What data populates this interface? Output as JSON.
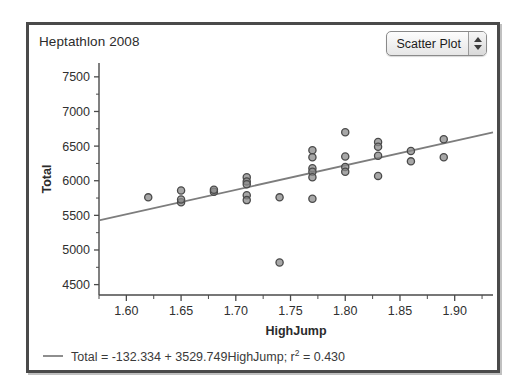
{
  "window": {
    "title": "Heptathlon 2008"
  },
  "controls": {
    "plot_type": {
      "selected": "Scatter Plot",
      "options": [
        "Scatter Plot",
        "Line Plot",
        "Bar Chart",
        "Histogram"
      ],
      "stepper_up_icon": "triangle-up-icon",
      "stepper_down_icon": "triangle-down-icon"
    }
  },
  "legend": {
    "equation_text": "Total = -132.334 + 3529.749HighJump; r",
    "r2_exponent": "2",
    "r2_value": " = 0.430",
    "line_color": "#8e8e8e"
  },
  "colors": {
    "point_fill": "#8a8a8a",
    "point_stroke": "#4a4a4a",
    "fit_line": "#7d7d7d",
    "axis": "#4a4a4a",
    "frame": "#4a4a4a"
  },
  "chart_data": {
    "type": "scatter",
    "title": "Heptathlon 2008",
    "xlabel": "HighJump",
    "ylabel": "Total",
    "xlim": [
      1.575,
      1.935
    ],
    "ylim": [
      4350,
      7700
    ],
    "xticks": [
      1.6,
      1.65,
      1.7,
      1.75,
      1.8,
      1.85,
      1.9
    ],
    "xtick_labels": [
      "1.60",
      "1.65",
      "1.70",
      "1.75",
      "1.80",
      "1.85",
      "1.90"
    ],
    "yticks": [
      4500,
      5000,
      5500,
      6000,
      6500,
      7000,
      7500
    ],
    "ytick_labels": [
      "4500",
      "5000",
      "5500",
      "6000",
      "6500",
      "7000",
      "7500"
    ],
    "minor_x_ticks": true,
    "minor_y_ticks": true,
    "grid": false,
    "legend_position": "below-axes",
    "fit": {
      "type": "linear-regression",
      "intercept": -132.334,
      "slope": 3529.749,
      "r_squared": 0.43,
      "label": "Total = -132.334 + 3529.749HighJump; r2 = 0.430"
    },
    "points": [
      {
        "x": 1.62,
        "y": 5760
      },
      {
        "x": 1.65,
        "y": 5860
      },
      {
        "x": 1.65,
        "y": 5690
      },
      {
        "x": 1.65,
        "y": 5730
      },
      {
        "x": 1.68,
        "y": 5840
      },
      {
        "x": 1.68,
        "y": 5870
      },
      {
        "x": 1.71,
        "y": 6050
      },
      {
        "x": 1.71,
        "y": 5990
      },
      {
        "x": 1.71,
        "y": 5950
      },
      {
        "x": 1.71,
        "y": 5790
      },
      {
        "x": 1.71,
        "y": 5720
      },
      {
        "x": 1.74,
        "y": 5760
      },
      {
        "x": 1.74,
        "y": 4820
      },
      {
        "x": 1.77,
        "y": 6440
      },
      {
        "x": 1.77,
        "y": 6340
      },
      {
        "x": 1.77,
        "y": 6180
      },
      {
        "x": 1.77,
        "y": 6130
      },
      {
        "x": 1.77,
        "y": 6050
      },
      {
        "x": 1.77,
        "y": 5740
      },
      {
        "x": 1.8,
        "y": 6700
      },
      {
        "x": 1.8,
        "y": 6350
      },
      {
        "x": 1.8,
        "y": 6200
      },
      {
        "x": 1.8,
        "y": 6130
      },
      {
        "x": 1.83,
        "y": 6560
      },
      {
        "x": 1.83,
        "y": 6490
      },
      {
        "x": 1.83,
        "y": 6360
      },
      {
        "x": 1.83,
        "y": 6070
      },
      {
        "x": 1.86,
        "y": 6430
      },
      {
        "x": 1.86,
        "y": 6280
      },
      {
        "x": 1.89,
        "y": 6600
      },
      {
        "x": 1.89,
        "y": 6340
      }
    ]
  }
}
